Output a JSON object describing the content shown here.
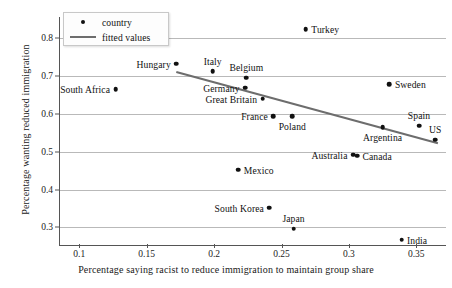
{
  "chart_data": {
    "type": "scatter",
    "title": "",
    "xlabel": "Percentage saying racist to reduce immigration to maintain group share",
    "ylabel": "Percentage wanting reduced immigration",
    "xlim": [
      0.085,
      0.372
    ],
    "ylim": [
      0.255,
      0.855
    ],
    "xticks": [
      "0.1",
      "0.15",
      "0.2",
      "0.25",
      "0.3",
      "0.35"
    ],
    "xtick_values": [
      0.1,
      0.15,
      0.2,
      0.25,
      0.3,
      0.35
    ],
    "yticks": [
      "0.8",
      "0.7",
      "0.6",
      "0.5",
      "0.4",
      "0.3"
    ],
    "ytick_values": [
      0.8,
      0.7,
      0.6,
      0.5,
      0.4,
      0.3
    ],
    "grid": "horizontal",
    "legend_position": "top-left",
    "legend": [
      {
        "label": "country",
        "marker": "dot",
        "color": "#111111"
      },
      {
        "label": "fitted values",
        "marker": "line",
        "color": "#6d6d6d"
      }
    ],
    "points": [
      {
        "label": "South Africa",
        "x": 0.127,
        "y": 0.665,
        "label_pos": "left"
      },
      {
        "label": "Hungary",
        "x": 0.172,
        "y": 0.732,
        "label_pos": "left"
      },
      {
        "label": "Italy",
        "x": 0.199,
        "y": 0.712,
        "label_pos": "above"
      },
      {
        "label": "Mexico",
        "x": 0.218,
        "y": 0.452,
        "label_pos": "right"
      },
      {
        "label": "Germany",
        "x": 0.223,
        "y": 0.669,
        "label_pos": "left"
      },
      {
        "label": "Belgium",
        "x": 0.224,
        "y": 0.695,
        "label_pos": "above"
      },
      {
        "label": "Great Britain",
        "x": 0.236,
        "y": 0.64,
        "label_pos": "left"
      },
      {
        "label": "South Korea",
        "x": 0.241,
        "y": 0.352,
        "label_pos": "left"
      },
      {
        "label": "France",
        "x": 0.244,
        "y": 0.594,
        "label_pos": "left"
      },
      {
        "label": "Poland",
        "x": 0.258,
        "y": 0.594,
        "label_pos": "below"
      },
      {
        "label": "Japan",
        "x": 0.259,
        "y": 0.297,
        "label_pos": "above"
      },
      {
        "label": "Turkey",
        "x": 0.268,
        "y": 0.823,
        "label_pos": "right"
      },
      {
        "label": "Australia",
        "x": 0.303,
        "y": 0.492,
        "label_pos": "left"
      },
      {
        "label": "Canada",
        "x": 0.306,
        "y": 0.489,
        "label_pos": "right"
      },
      {
        "label": "Argentina",
        "x": 0.325,
        "y": 0.565,
        "label_pos": "below"
      },
      {
        "label": "Sweden",
        "x": 0.33,
        "y": 0.678,
        "label_pos": "right"
      },
      {
        "label": "India",
        "x": 0.339,
        "y": 0.268,
        "label_pos": "right"
      },
      {
        "label": "Spain",
        "x": 0.352,
        "y": 0.568,
        "label_pos": "above"
      },
      {
        "label": "US",
        "x": 0.364,
        "y": 0.532,
        "label_pos": "above"
      }
    ],
    "fitted_line": {
      "name": "fitted values",
      "x_start": 0.172,
      "y_start": 0.71,
      "x_end": 0.366,
      "y_end": 0.522,
      "color": "#6d6d6d"
    }
  }
}
